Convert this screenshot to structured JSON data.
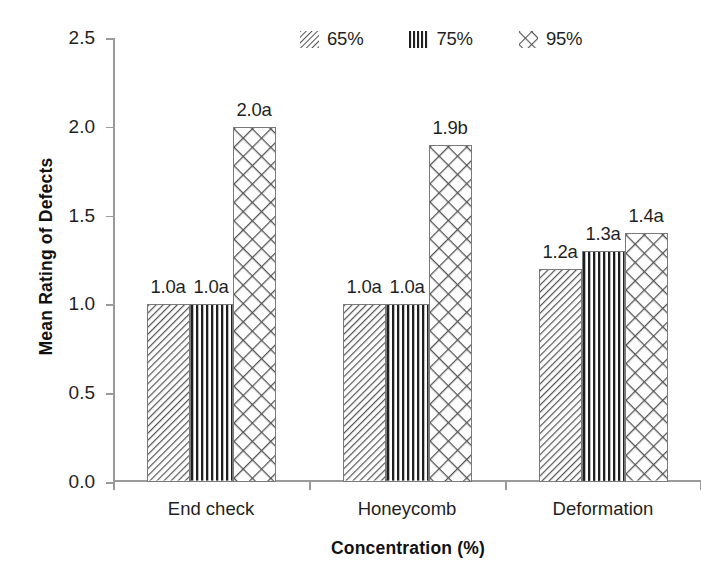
{
  "chart_data": {
    "type": "bar",
    "title": "",
    "xlabel": "Concentration (%)",
    "ylabel": "Mean Rating of Defects",
    "categories": [
      "End check",
      "Honeycomb",
      "Deformation"
    ],
    "series": [
      {
        "name": "65%",
        "pattern": "diagonal-hatch",
        "values": [
          1.0,
          1.0,
          1.2
        ],
        "labels": [
          "1.0a",
          "1.0a",
          "1.2a"
        ]
      },
      {
        "name": "75%",
        "pattern": "vertical-lines",
        "values": [
          1.0,
          1.0,
          1.3
        ],
        "labels": [
          "1.0a",
          "1.0a",
          "1.3a"
        ]
      },
      {
        "name": "95%",
        "pattern": "crosshatch-diamond",
        "values": [
          2.0,
          1.9,
          1.4
        ],
        "labels": [
          "2.0a",
          "1.9b",
          "1.4a"
        ]
      }
    ],
    "ylim": [
      0.0,
      2.5
    ],
    "yticks": [
      "0.0",
      "0.5",
      "1.0",
      "1.5",
      "2.0",
      "2.5"
    ],
    "ytick_values": [
      0.0,
      0.5,
      1.0,
      1.5,
      2.0,
      2.5
    ],
    "grid": false,
    "legend_position": "top-center",
    "legend_entries": [
      "65%",
      "75%",
      "95%"
    ]
  },
  "legend": {
    "items": [
      {
        "label": "65%",
        "icon": "diagonal-hatch-swatch"
      },
      {
        "label": "75%",
        "icon": "vertical-lines-swatch"
      },
      {
        "label": "95%",
        "icon": "crosshatch-swatch"
      }
    ]
  },
  "axes": {
    "y_title": "Mean Rating of Defects",
    "x_title": "Concentration (%)",
    "y_ticks": [
      "2.5",
      "2.0",
      "1.5",
      "1.0",
      "0.5",
      "0.0"
    ],
    "x_categories": [
      "End check",
      "Honeycomb",
      "Deformation"
    ]
  },
  "colors": {
    "ink": "#1f1f1f",
    "axis": "#9a9a9a",
    "pattern": "#4a4a4a",
    "background": "#ffffff"
  }
}
